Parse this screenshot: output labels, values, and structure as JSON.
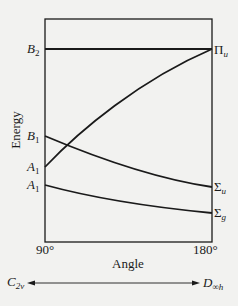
{
  "diagram": {
    "y_axis_label": "Energy",
    "x_axis_label": "Angle",
    "x_ticks": [
      "90°",
      "180°"
    ],
    "left_labels": [
      {
        "main": "B",
        "sub": "2"
      },
      {
        "main": "B",
        "sub": "1"
      },
      {
        "main": "A",
        "sub": "1"
      },
      {
        "main": "A",
        "sub": "1"
      }
    ],
    "right_labels": [
      {
        "main": "Π",
        "sub": "u"
      },
      {
        "main": "Σ",
        "sub": "u"
      },
      {
        "main": "Σ",
        "sub": "g"
      }
    ],
    "symmetry_left": {
      "main": "C",
      "sub": "2v"
    },
    "symmetry_right": {
      "main": "D",
      "sub": "∞h"
    },
    "correlations": [
      {
        "from": "B2",
        "to": "Πu",
        "shape": "flat"
      },
      {
        "from": "A1 (upper)",
        "to": "Πu",
        "shape": "rising"
      },
      {
        "from": "B1",
        "to": "Σu",
        "shape": "falling"
      },
      {
        "from": "A1 (lower)",
        "to": "Σg",
        "shape": "slightly falling"
      }
    ]
  }
}
